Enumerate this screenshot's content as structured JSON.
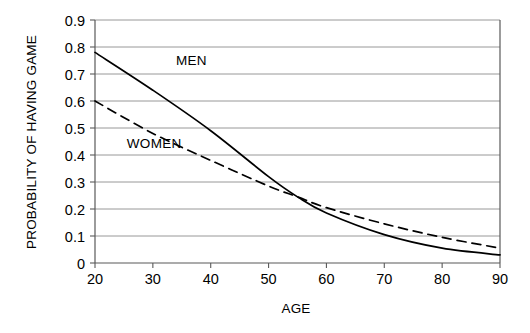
{
  "chart_data": {
    "type": "line",
    "title": "",
    "xlabel": "AGE",
    "ylabel": "PROBABILITY OF HAVING GAME",
    "xlim": [
      20,
      90
    ],
    "ylim": [
      0,
      0.9
    ],
    "grid": true,
    "grid_axis": "y",
    "legend": "inline-annotations",
    "x": [
      20,
      30,
      40,
      50,
      55,
      60,
      70,
      80,
      90
    ],
    "xticks": [
      "20",
      "30",
      "40",
      "50",
      "60",
      "70",
      "80",
      "90"
    ],
    "xtick_values": [
      20,
      30,
      40,
      50,
      60,
      70,
      80,
      90
    ],
    "yticks": [
      "0",
      "0.1",
      "0.2",
      "0.3",
      "0.4",
      "0.5",
      "0.6",
      "0.7",
      "0.8",
      "0.9"
    ],
    "ytick_values": [
      0,
      0.1,
      0.2,
      0.3,
      0.4,
      0.5,
      0.6,
      0.7,
      0.8,
      0.9
    ],
    "series": [
      {
        "name": "MEN",
        "style": "solid",
        "color": "#000000",
        "label_x": 34,
        "label_y": 0.735,
        "values": [
          0.78,
          0.64,
          0.49,
          0.32,
          0.245,
          0.185,
          0.105,
          0.055,
          0.03
        ]
      },
      {
        "name": "WOMEN",
        "style": "dashed",
        "color": "#000000",
        "label_x": 25.5,
        "label_y": 0.425,
        "values": [
          0.6,
          0.48,
          0.38,
          0.285,
          0.245,
          0.205,
          0.145,
          0.095,
          0.055
        ]
      }
    ]
  },
  "axis_title_x": "AGE",
  "axis_title_y": "PROBABILITY OF HAVING GAME"
}
